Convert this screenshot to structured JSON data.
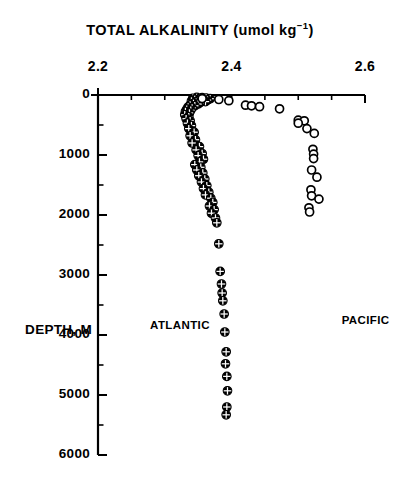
{
  "chart_data": {
    "type": "scatter",
    "title": "TOTAL ALKALINITY (umol kg",
    "title_sup": "−1",
    "title_tail": ")",
    "title_full": "TOTAL ALKALINITY (umol kg−1)",
    "xlabel": "TOTAL ALKALINITY (umol kg-1)",
    "ylabel": "DEPTH, M",
    "xlim": [
      2.2,
      2.6
    ],
    "ylim": [
      0,
      6000
    ],
    "y_inverted": true,
    "grid": false,
    "legend_position": "in-plot-annotations",
    "x_ticks": [
      2.2,
      2.4,
      2.6
    ],
    "x_tick_labels": [
      "2.2",
      "2.4",
      "2.6"
    ],
    "x_minor_step": 0.05,
    "y_ticks": [
      0,
      1000,
      2000,
      3000,
      4000,
      5000,
      6000
    ],
    "y_tick_labels": [
      "0",
      "1000",
      "2000",
      "3000",
      "4000",
      "5000",
      "6000"
    ],
    "y_minor_step": 500,
    "axis_style": "left-and-top-spines",
    "annotations": [
      {
        "text": "ATLANTIC",
        "x": 2.278,
        "y": 3850
      },
      {
        "text": "PACIFIC",
        "x": 2.565,
        "y": 3760
      }
    ],
    "series": [
      {
        "name": "ATLANTIC",
        "marker": "circled-plus-filled",
        "marker_fill": "#000000",
        "marker_edge": "#000000",
        "points": [
          [
            2.348,
            40
          ],
          [
            2.356,
            45
          ],
          [
            2.362,
            50
          ],
          [
            2.342,
            55
          ],
          [
            2.352,
            60
          ],
          [
            2.368,
            62
          ],
          [
            2.345,
            75
          ],
          [
            2.358,
            80
          ],
          [
            2.364,
            85
          ],
          [
            2.35,
            95
          ],
          [
            2.34,
            100
          ],
          [
            2.355,
            105
          ],
          [
            2.361,
            110
          ],
          [
            2.347,
            120
          ],
          [
            2.353,
            128
          ],
          [
            2.343,
            140
          ],
          [
            2.35,
            150
          ],
          [
            2.338,
            165
          ],
          [
            2.345,
            180
          ],
          [
            2.335,
            200
          ],
          [
            2.341,
            215
          ],
          [
            2.333,
            235
          ],
          [
            2.339,
            255
          ],
          [
            2.331,
            275
          ],
          [
            2.337,
            300
          ],
          [
            2.33,
            330
          ],
          [
            2.336,
            360
          ],
          [
            2.332,
            395
          ],
          [
            2.338,
            430
          ],
          [
            2.334,
            470
          ],
          [
            2.34,
            510
          ],
          [
            2.336,
            560
          ],
          [
            2.344,
            620
          ],
          [
            2.338,
            680
          ],
          [
            2.346,
            745
          ],
          [
            2.341,
            800
          ],
          [
            2.352,
            860
          ],
          [
            2.347,
            915
          ],
          [
            2.356,
            975
          ],
          [
            2.35,
            1010
          ],
          [
            2.358,
            1070
          ],
          [
            2.352,
            1115
          ],
          [
            2.345,
            1160
          ],
          [
            2.354,
            1205
          ],
          [
            2.348,
            1250
          ],
          [
            2.357,
            1300
          ],
          [
            2.351,
            1345
          ],
          [
            2.36,
            1400
          ],
          [
            2.355,
            1450
          ],
          [
            2.363,
            1510
          ],
          [
            2.358,
            1560
          ],
          [
            2.366,
            1620
          ],
          [
            2.361,
            1665
          ],
          [
            2.369,
            1720
          ],
          [
            2.372,
            1790
          ],
          [
            2.367,
            1850
          ],
          [
            2.374,
            1910
          ],
          [
            2.37,
            1970
          ],
          [
            2.376,
            2050
          ],
          [
            2.378,
            2130
          ],
          [
            2.381,
            2480
          ],
          [
            2.383,
            2940
          ],
          [
            2.385,
            3150
          ],
          [
            2.386,
            3300
          ],
          [
            2.387,
            3430
          ],
          [
            2.389,
            3650
          ],
          [
            2.39,
            3950
          ],
          [
            2.392,
            4280
          ],
          [
            2.391,
            4480
          ],
          [
            2.393,
            4690
          ],
          [
            2.394,
            4930
          ],
          [
            2.393,
            5200
          ],
          [
            2.392,
            5330
          ]
        ]
      },
      {
        "name": "PACIFIC",
        "marker": "open-circle",
        "marker_fill": "#ffffff",
        "marker_edge": "#000000",
        "points": [
          [
            2.356,
            60
          ],
          [
            2.381,
            75
          ],
          [
            2.396,
            95
          ],
          [
            2.421,
            170
          ],
          [
            2.43,
            180
          ],
          [
            2.442,
            195
          ],
          [
            2.472,
            230
          ],
          [
            2.5,
            420
          ],
          [
            2.509,
            430
          ],
          [
            2.5,
            470
          ],
          [
            2.513,
            560
          ],
          [
            2.524,
            640
          ],
          [
            2.522,
            905
          ],
          [
            2.523,
            985
          ],
          [
            2.523,
            1060
          ],
          [
            2.52,
            1250
          ],
          [
            2.528,
            1370
          ],
          [
            2.519,
            1580
          ],
          [
            2.52,
            1680
          ],
          [
            2.531,
            1735
          ],
          [
            2.516,
            1880
          ],
          [
            2.517,
            1950
          ]
        ]
      }
    ]
  },
  "geometry": {
    "plot_left_px": 98,
    "plot_right_px": 365,
    "plot_top_px": 95,
    "plot_bottom_px": 455
  }
}
